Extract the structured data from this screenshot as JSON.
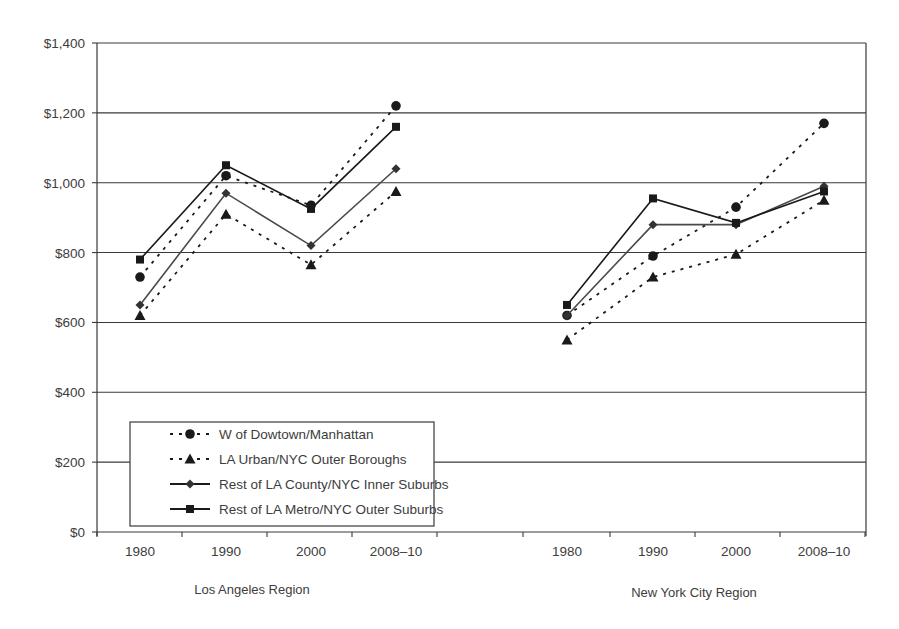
{
  "chart_data": {
    "type": "line",
    "title": "",
    "xlabel": "",
    "ylabel": "",
    "ylim": [
      0,
      1400
    ],
    "yticks": [
      "$0",
      "$200",
      "$400",
      "$600",
      "$800",
      "$1,000",
      "$1,200",
      "$1,400"
    ],
    "ytick_values": [
      0,
      200,
      400,
      600,
      800,
      1000,
      1200,
      1400
    ],
    "grid": true,
    "legend_position": "lower-left inside plot",
    "groups": [
      {
        "name": "Los Angeles Region",
        "categories": [
          "1980",
          "1990",
          "2000",
          "2008–10"
        ],
        "series": [
          {
            "name": "W of Dowtown/Manhattan",
            "marker": "circle",
            "line": "dotted",
            "values": [
              730,
              1020,
              935,
              1220
            ]
          },
          {
            "name": "LA Urban/NYC Outer Boroughs",
            "marker": "triangle",
            "line": "dotted",
            "values": [
              620,
              910,
              765,
              975
            ]
          },
          {
            "name": "Rest of LA County/NYC Inner Suburbs",
            "marker": "diamond",
            "line": "solid",
            "values": [
              650,
              970,
              820,
              1040
            ]
          },
          {
            "name": "Rest of LA Metro/NYC Outer Suburbs",
            "marker": "square",
            "line": "solid",
            "values": [
              780,
              1050,
              925,
              1160
            ]
          }
        ]
      },
      {
        "name": "New York City Region",
        "categories": [
          "1980",
          "1990",
          "2000",
          "2008–10"
        ],
        "series": [
          {
            "name": "W of Dowtown/Manhattan",
            "marker": "circle",
            "line": "dotted",
            "values": [
              620,
              790,
              930,
              1170
            ]
          },
          {
            "name": "LA Urban/NYC Outer Boroughs",
            "marker": "triangle",
            "line": "dotted",
            "values": [
              550,
              730,
              795,
              950
            ]
          },
          {
            "name": "Rest of LA County/NYC Inner Suburbs",
            "marker": "diamond",
            "line": "solid",
            "values": [
              620,
              880,
              880,
              990
            ]
          },
          {
            "name": "Rest of LA Metro/NYC Outer Suburbs",
            "marker": "square",
            "line": "solid",
            "values": [
              650,
              955,
              885,
              975
            ]
          }
        ]
      }
    ],
    "legend": [
      "W of Dowtown/Manhattan",
      "LA Urban/NYC Outer Boroughs",
      "Rest of LA County/NYC Inner Suburbs",
      "Rest of LA Metro/NYC Outer Suburbs"
    ]
  },
  "labels": {
    "region_la": "Los Angeles Region",
    "region_nyc": "New York City Region",
    "caption_partial": "Figure 2.1..."
  },
  "colors": {
    "axis": "#3a3a3a",
    "series": "#1a1a1a",
    "diamond_line": "#4a4a4a",
    "text": "#3d3d3d"
  }
}
